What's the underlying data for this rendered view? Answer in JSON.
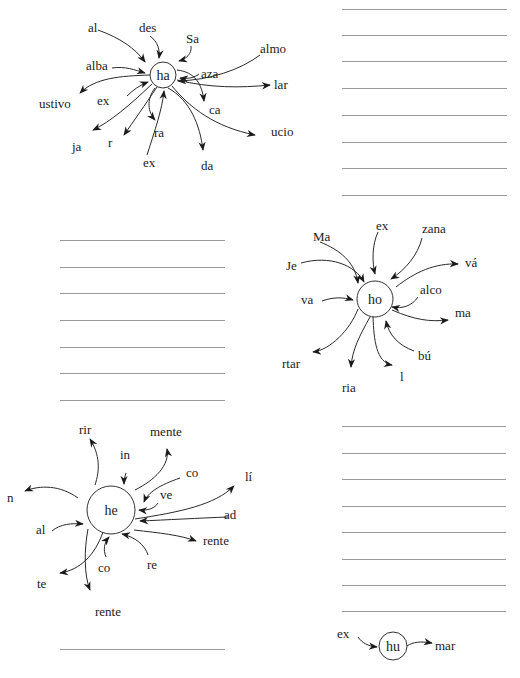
{
  "diagrams": [
    {
      "id": "ha",
      "center": {
        "label": "ha",
        "x": 163,
        "y": 75,
        "r": 13
      },
      "incoming": [
        {
          "label": "al",
          "x": 88,
          "y": 28
        },
        {
          "label": "des",
          "x": 139,
          "y": 28
        },
        {
          "label": "Sa",
          "x": 186,
          "y": 39
        },
        {
          "label": "alba",
          "x": 86,
          "y": 66
        },
        {
          "label": "almo",
          "x": 260,
          "y": 49
        },
        {
          "label": "aza",
          "x": 201,
          "y": 74
        },
        {
          "label": "ex",
          "x": 97,
          "y": 101
        },
        {
          "label": "ex",
          "x": 143,
          "y": 163
        }
      ],
      "outgoing": [
        {
          "label": "ustivo",
          "x": 39,
          "y": 104
        },
        {
          "label": "ja",
          "x": 72,
          "y": 147
        },
        {
          "label": "r",
          "x": 108,
          "y": 143
        },
        {
          "label": "ra",
          "x": 154,
          "y": 133
        },
        {
          "label": "ca",
          "x": 209,
          "y": 110
        },
        {
          "label": "lar",
          "x": 274,
          "y": 85
        },
        {
          "label": "ucio",
          "x": 271,
          "y": 132
        },
        {
          "label": "da",
          "x": 201,
          "y": 166
        }
      ]
    },
    {
      "id": "ho",
      "center": {
        "label": "ho",
        "x": 375,
        "y": 299,
        "r": 18
      },
      "incoming": [
        {
          "label": "Ma",
          "x": 313,
          "y": 237
        },
        {
          "label": "ex",
          "x": 376,
          "y": 226
        },
        {
          "label": "zana",
          "x": 422,
          "y": 229
        },
        {
          "label": "Je",
          "x": 286,
          "y": 266
        },
        {
          "label": "va",
          "x": 301,
          "y": 300
        },
        {
          "label": "alco",
          "x": 420,
          "y": 290
        },
        {
          "label": "bú",
          "x": 418,
          "y": 356
        }
      ],
      "outgoing": [
        {
          "label": "vá",
          "x": 465,
          "y": 263
        },
        {
          "label": "ma",
          "x": 455,
          "y": 313
        },
        {
          "label": "rtar",
          "x": 282,
          "y": 364
        },
        {
          "label": "ria",
          "x": 342,
          "y": 388
        },
        {
          "label": "l",
          "x": 400,
          "y": 377
        }
      ]
    },
    {
      "id": "he",
      "center": {
        "label": "he",
        "x": 111,
        "y": 510,
        "r": 24
      },
      "incoming": [
        {
          "label": "in",
          "x": 120,
          "y": 455
        },
        {
          "label": "co",
          "x": 186,
          "y": 473
        },
        {
          "label": "ve",
          "x": 160,
          "y": 495
        },
        {
          "label": "ad",
          "x": 224,
          "y": 515
        },
        {
          "label": "al",
          "x": 36,
          "y": 530
        },
        {
          "label": "co",
          "x": 98,
          "y": 568
        },
        {
          "label": "re",
          "x": 147,
          "y": 565
        }
      ],
      "outgoing": [
        {
          "label": "rir",
          "x": 79,
          "y": 430
        },
        {
          "label": "mente",
          "x": 150,
          "y": 432
        },
        {
          "label": "lí",
          "x": 245,
          "y": 477
        },
        {
          "label": "n",
          "x": 7,
          "y": 498
        },
        {
          "label": "rente",
          "x": 203,
          "y": 541
        },
        {
          "label": "te",
          "x": 37,
          "y": 584
        },
        {
          "label": "rente",
          "x": 95,
          "y": 612
        }
      ]
    },
    {
      "id": "hu",
      "center": {
        "label": "hu",
        "x": 393,
        "y": 646,
        "r": 14
      },
      "incoming": [
        {
          "label": "ex",
          "x": 337,
          "y": 634
        }
      ],
      "outgoing": [
        {
          "label": "mar",
          "x": 435,
          "y": 646
        }
      ]
    }
  ],
  "writing_lines": {
    "top_right": {
      "x1": 342,
      "x2": 507,
      "ys": [
        9,
        35,
        61,
        88,
        115,
        142,
        168,
        195
      ]
    },
    "middle_left": {
      "x1": 60,
      "x2": 225,
      "ys": [
        240,
        267,
        293,
        320,
        347,
        373,
        400
      ]
    },
    "bottom_right": {
      "x1": 342,
      "x2": 506,
      "ys": [
        426,
        453,
        479,
        506,
        532,
        559,
        585,
        611
      ]
    },
    "bottom_left": {
      "x1": 60,
      "x2": 225,
      "ys": [
        649
      ]
    }
  }
}
